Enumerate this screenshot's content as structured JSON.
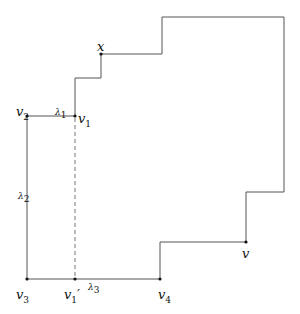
{
  "diagram": {
    "polygon_points": [
      [
        101,
        54
      ],
      [
        101,
        25
      ],
      [
        162,
        54
      ],
      [
        162,
        17
      ],
      [
        284,
        17
      ],
      [
        284,
        192
      ],
      [
        246,
        192
      ],
      [
        246,
        242
      ],
      [
        160,
        242
      ]
    ],
    "labels": {
      "x": "x",
      "v": "v",
      "v1": "v",
      "v1_sub": "1",
      "v2": "v",
      "v2_sub": "2",
      "v3": "v",
      "v3_sub": "3",
      "v4": "v",
      "v4_sub": "4",
      "v1p": "v",
      "v1p_sub": "1",
      "v1p_prime": "′",
      "lambda1": "λ",
      "lambda1_sub": "1",
      "lambda2": "λ",
      "lambda2_sub": "2",
      "lambda3": "λ",
      "lambda3_sub": "3"
    },
    "colors": {
      "line": "#555555",
      "dot": "#111111"
    }
  }
}
